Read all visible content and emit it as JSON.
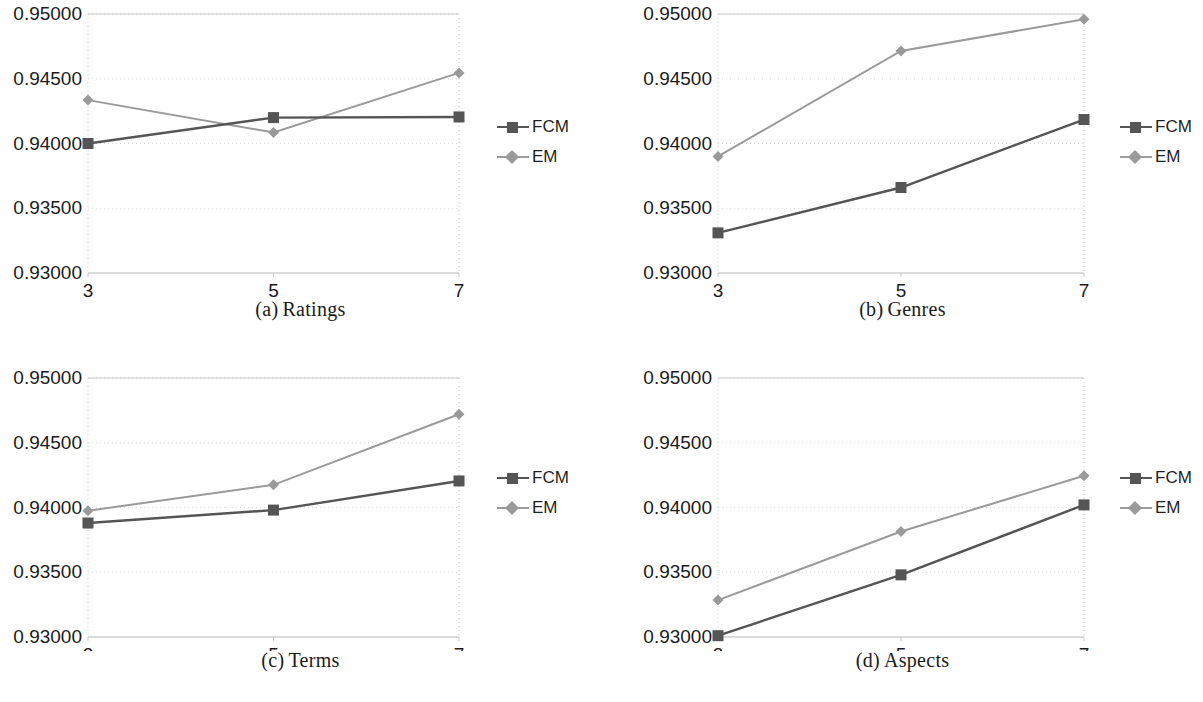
{
  "figure": {
    "series_names": [
      "FCM",
      "EM"
    ],
    "colors": {
      "fcm": "#555555",
      "em": "#9a9a9a",
      "grid": "#d8d8d8",
      "axis": "#c9c9c9",
      "text": "#1b1b1b"
    },
    "y_ticks": [
      "0.93000",
      "0.93500",
      "0.94000",
      "0.94500",
      "0.95000"
    ],
    "x_ticks": [
      "3",
      "5",
      "7"
    ]
  },
  "subfigures": [
    {
      "index": "(a)",
      "name": "Ratings",
      "caption_index": "(a)",
      "caption_text": "Ratings",
      "legend": [
        {
          "label": "FCM",
          "marker": "square",
          "color": "#555555"
        },
        {
          "label": "EM",
          "marker": "diamond",
          "color": "#9a9a9a"
        }
      ]
    },
    {
      "index": "(b)",
      "name": "Genres",
      "caption_index": "(b)",
      "caption_text": "Genres",
      "legend": [
        {
          "label": "FCM",
          "marker": "square",
          "color": "#555555"
        },
        {
          "label": "EM",
          "marker": "diamond",
          "color": "#9a9a9a"
        }
      ]
    },
    {
      "index": "(c)",
      "name": "Terms",
      "caption_index": "(c)",
      "caption_text": "Terms",
      "legend": [
        {
          "label": "FCM",
          "marker": "square",
          "color": "#555555"
        },
        {
          "label": "EM",
          "marker": "diamond",
          "color": "#9a9a9a"
        }
      ]
    },
    {
      "index": "(d)",
      "name": "Aspects",
      "caption_index": "(d)",
      "caption_text": "Aspects",
      "legend": [
        {
          "label": "FCM",
          "marker": "square",
          "color": "#555555"
        },
        {
          "label": "EM",
          "marker": "diamond",
          "color": "#9a9a9a"
        }
      ]
    }
  ],
  "chart_data": [
    {
      "type": "line",
      "title": "(a) Ratings",
      "xlabel": "",
      "ylabel": "",
      "x": [
        3,
        5,
        7
      ],
      "categories": [
        "3",
        "5",
        "7"
      ],
      "xtick_labels": [
        "3",
        "5",
        "7"
      ],
      "ytick_labels": [
        "0.93000",
        "0.93500",
        "0.94000",
        "0.94500",
        "0.95000"
      ],
      "ylim": [
        0.93,
        0.95
      ],
      "yticks": [
        0.93,
        0.935,
        0.94,
        0.945,
        0.95
      ],
      "grid": true,
      "legend_position": "right",
      "series": [
        {
          "name": "FCM",
          "values": [
            0.94,
            0.942,
            0.94205
          ],
          "color": "#555555",
          "marker": "square"
        },
        {
          "name": "EM",
          "values": [
            0.94335,
            0.94085,
            0.94545
          ],
          "color": "#9a9a9a",
          "marker": "diamond"
        }
      ]
    },
    {
      "type": "line",
      "title": "(b) Genres",
      "xlabel": "",
      "ylabel": "",
      "x": [
        3,
        5,
        7
      ],
      "categories": [
        "3",
        "5",
        "7"
      ],
      "xtick_labels": [
        "3",
        "5",
        "7"
      ],
      "ytick_labels": [
        "0.93000",
        "0.93500",
        "0.94000",
        "0.94500",
        "0.95000"
      ],
      "ylim": [
        0.93,
        0.95
      ],
      "yticks": [
        0.93,
        0.935,
        0.94,
        0.945,
        0.95
      ],
      "grid": true,
      "legend_position": "right",
      "series": [
        {
          "name": "FCM",
          "values": [
            0.9331,
            0.9366,
            0.94185
          ],
          "color": "#555555",
          "marker": "square"
        },
        {
          "name": "EM",
          "values": [
            0.939,
            0.94715,
            0.9496
          ],
          "color": "#9a9a9a",
          "marker": "diamond"
        }
      ]
    },
    {
      "type": "line",
      "title": "(c) Terms",
      "xlabel": "",
      "ylabel": "",
      "x": [
        3,
        5,
        7
      ],
      "categories": [
        "3",
        "5",
        "7"
      ],
      "xtick_labels": [
        "3",
        "5",
        "7"
      ],
      "ytick_labels": [
        "0.93000",
        "0.93500",
        "0.94000",
        "0.94500",
        "0.95000"
      ],
      "ylim": [
        0.93,
        0.95
      ],
      "yticks": [
        0.93,
        0.935,
        0.94,
        0.945,
        0.95
      ],
      "grid": true,
      "legend_position": "right",
      "series": [
        {
          "name": "FCM",
          "values": [
            0.9388,
            0.9398,
            0.94205
          ],
          "color": "#555555",
          "marker": "square"
        },
        {
          "name": "EM",
          "values": [
            0.93975,
            0.94175,
            0.9472
          ],
          "color": "#9a9a9a",
          "marker": "diamond"
        }
      ]
    },
    {
      "type": "line",
      "title": "(d) Aspects",
      "xlabel": "",
      "ylabel": "",
      "x": [
        3,
        5,
        7
      ],
      "categories": [
        "3",
        "5",
        "7"
      ],
      "xtick_labels": [
        "3",
        "5",
        "7"
      ],
      "ytick_labels": [
        "0.93000",
        "0.93500",
        "0.94000",
        "0.94500",
        "0.95000"
      ],
      "ylim": [
        0.93,
        0.95
      ],
      "yticks": [
        0.93,
        0.935,
        0.94,
        0.945,
        0.95
      ],
      "grid": true,
      "legend_position": "right",
      "series": [
        {
          "name": "FCM",
          "values": [
            0.9301,
            0.9348,
            0.9402
          ],
          "color": "#555555",
          "marker": "square"
        },
        {
          "name": "EM",
          "values": [
            0.93285,
            0.93815,
            0.94245
          ],
          "color": "#9a9a9a",
          "marker": "diamond"
        }
      ]
    }
  ]
}
